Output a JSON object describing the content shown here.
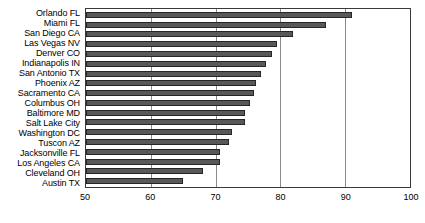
{
  "chart_data": {
    "type": "bar",
    "orientation": "horizontal",
    "title": "",
    "subtitle": "",
    "xlabel": "",
    "ylabel": "",
    "xlim": [
      50,
      100
    ],
    "ylim": null,
    "grid": true,
    "legend": null,
    "xticks": [
      50,
      60,
      70,
      80,
      90,
      100
    ],
    "xtick_labels": [
      "50",
      "60",
      "70",
      "80",
      "90",
      "100"
    ],
    "categories": [
      "Orlando FL",
      "Miami FL",
      "San Diego CA",
      "Las Vegas NV",
      "Denver CO",
      "Indianapolis IN",
      "San Antonio TX",
      "Phoenix AZ",
      "Sacramento CA",
      "Columbus OH",
      "Baltimore MD",
      "Salt Lake City",
      "Washington DC",
      "Tuscon AZ",
      "Jacksonville FL",
      "Los Angeles CA",
      "Cleveland OH",
      "Austin TX"
    ],
    "values": [
      91.0,
      87.0,
      82.0,
      79.5,
      78.7,
      77.8,
      77.0,
      76.2,
      76.0,
      75.3,
      74.5,
      74.5,
      72.5,
      72.0,
      70.7,
      70.7,
      68.1,
      65.0
    ],
    "series": [
      {
        "name": "",
        "values": [
          91.0,
          87.0,
          82.0,
          79.5,
          78.7,
          77.8,
          77.0,
          76.2,
          76.0,
          75.3,
          74.5,
          74.5,
          72.5,
          72.0,
          70.7,
          70.7,
          68.1,
          65.0
        ]
      }
    ],
    "colors": {
      "bar_fill": "#585858",
      "bar_stroke": "#262626",
      "gridline": "#8a8a8a",
      "axis": "#3a3a3a",
      "background": "#ffffff",
      "text": "#000000"
    }
  }
}
